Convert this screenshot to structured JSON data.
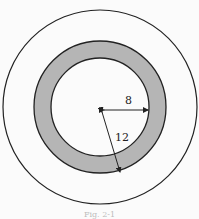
{
  "diagram": {
    "type": "concentric-circles",
    "outer_circle": {
      "cx": 100,
      "cy": 107,
      "r": 97
    },
    "ring": {
      "outer_r": 66,
      "inner_r": 49,
      "fill": "#b8b8b8"
    },
    "labels": {
      "inner_radius": "8",
      "outer_radius": "12"
    },
    "caption": "Fig. 2-1"
  }
}
